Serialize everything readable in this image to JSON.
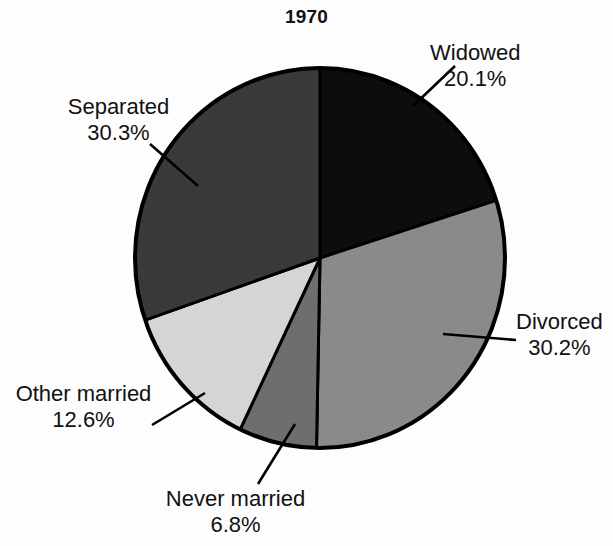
{
  "chart_data": {
    "type": "pie",
    "title": "1970",
    "xlabel": "",
    "ylabel": "",
    "legend_position": "none",
    "grid": false,
    "start_angle_deg": 0,
    "direction": "clockwise",
    "categories": [
      "Widowed",
      "Divorced",
      "Never married",
      "Other married",
      "Separated"
    ],
    "values": [
      20.1,
      30.2,
      6.8,
      12.6,
      30.3
    ],
    "value_labels": [
      "20.1%",
      "30.2%",
      "6.8%",
      "12.6%",
      "30.3%"
    ],
    "units": "percent",
    "slices": [
      {
        "label": "Widowed",
        "value": 20.1,
        "value_label": "20.1%",
        "color": "#0d0d0d",
        "start_deg": 0.0,
        "end_deg": 72.4
      },
      {
        "label": "Divorced",
        "value": 30.2,
        "value_label": "30.2%",
        "color": "#8a8a8a",
        "start_deg": 72.4,
        "end_deg": 181.1
      },
      {
        "label": "Never married",
        "value": 6.8,
        "value_label": "6.8%",
        "color": "#6e6e6e",
        "start_deg": 181.1,
        "end_deg": 205.6
      },
      {
        "label": "Other married",
        "value": 12.6,
        "value_label": "12.6%",
        "color": "#d5d5d5",
        "start_deg": 205.6,
        "end_deg": 251.0
      },
      {
        "label": "Separated",
        "value": 30.3,
        "value_label": "30.3%",
        "color": "#3a3a3a",
        "start_deg": 251.0,
        "end_deg": 360.0
      }
    ]
  },
  "figure": {
    "title": "1970",
    "background_color": "#fdfdfd",
    "outline_color": "#000000",
    "text_color": "#111111"
  },
  "labels": {
    "widowed": {
      "name": "Widowed",
      "value": "20.1%"
    },
    "divorced": {
      "name": "Divorced",
      "value": "30.2%"
    },
    "separated": {
      "name": "Separated",
      "value": "30.3%"
    },
    "other_married": {
      "name": "Other married",
      "value": "12.6%"
    },
    "never_married": {
      "name": "Never married",
      "value": "6.8%"
    }
  }
}
